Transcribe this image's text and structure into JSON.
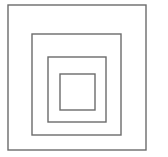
{
  "diagram": {
    "type": "nested-squares",
    "background": "#ffffff",
    "stroke_color": "#6b6b6b",
    "stroke_width": 1.4,
    "squares": [
      {
        "name": "outer-square",
        "x": 8,
        "y": 5,
        "w": 138,
        "h": 145
      },
      {
        "name": "second-square",
        "x": 32,
        "y": 34,
        "w": 89,
        "h": 101
      },
      {
        "name": "third-square",
        "x": 48,
        "y": 57,
        "w": 58,
        "h": 65
      },
      {
        "name": "inner-square",
        "x": 60,
        "y": 74,
        "w": 35,
        "h": 36
      }
    ]
  }
}
